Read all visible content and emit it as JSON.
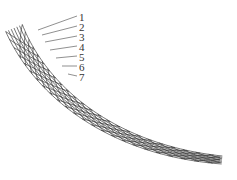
{
  "diagram": {
    "type": "curved lattice / braided mesh structure",
    "labels": [
      {
        "id": "1",
        "text": "1"
      },
      {
        "id": "2",
        "text": "2"
      },
      {
        "id": "3",
        "text": "3"
      },
      {
        "id": "4",
        "text": "4"
      },
      {
        "id": "5",
        "text": "5"
      },
      {
        "id": "6",
        "text": "6"
      },
      {
        "id": "7",
        "text": "7"
      }
    ],
    "stroke_color": "#3a3a3a",
    "background": "#ffffff"
  }
}
